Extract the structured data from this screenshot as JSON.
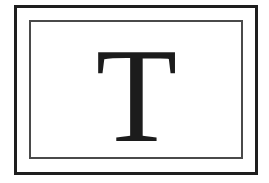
{
  "card": {
    "letter": "T",
    "colors": {
      "outer_border": "#1e1e1e",
      "inner_border": "#4a4a4a",
      "letter": "#1c1c1c",
      "background": "#ffffff"
    }
  }
}
